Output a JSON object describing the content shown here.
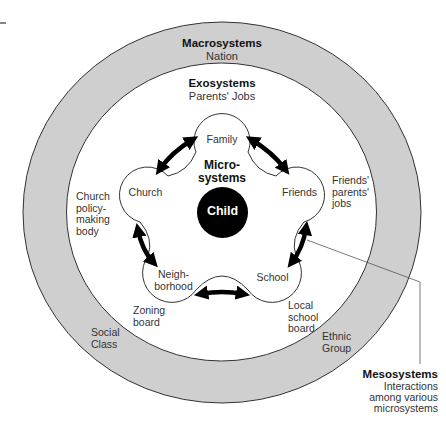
{
  "diagram": {
    "colors": {
      "ring_fill": "#cfcfcf",
      "ring_stroke": "#333333",
      "child_fill": "#000000",
      "arrow": "#000000"
    },
    "macrosystems": {
      "title": "Macrosystems",
      "subtitle": "Nation",
      "examples": [
        "Social\nClass",
        "Ethnic\nGroup"
      ]
    },
    "exosystems": {
      "title": "Exosystems",
      "subtitle": "Parents' Jobs",
      "examples": {
        "church": "Church\npolicy-\nmaking\nbody",
        "friends": "Friends'\nparents'\njobs",
        "zoning": "Zoning\nboard",
        "school": "Local\nschool\nboard"
      }
    },
    "microsystems": {
      "title": "Micro-\nsystems",
      "petals": [
        "Family",
        "Church",
        "Friends",
        "Neigh-\nborhood",
        "School"
      ]
    },
    "center": {
      "label": "Child"
    },
    "mesosystems": {
      "title": "Mesosystems",
      "subtitle": "Interactions\namong various\nmicrosystems"
    }
  }
}
